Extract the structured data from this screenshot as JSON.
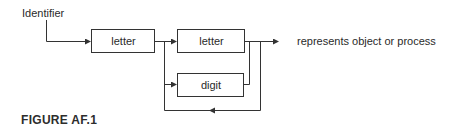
{
  "diagram": {
    "start_label": "Identifier",
    "nodes": [
      {
        "id": "letter1",
        "label": "letter"
      },
      {
        "id": "letter2",
        "label": "letter"
      },
      {
        "id": "digit",
        "label": "digit"
      }
    ],
    "output_label": "represents object or process",
    "edges": [
      {
        "from": "Identifier",
        "to": "letter1"
      },
      {
        "from": "letter1",
        "to": "letter2"
      },
      {
        "from": "letter1",
        "to": "digit"
      },
      {
        "from": "letter2",
        "to": "output"
      },
      {
        "from": "digit",
        "to": "output"
      },
      {
        "from": "output",
        "to": "loop-back",
        "note": "loop returns to before letter/digit choice"
      }
    ],
    "colors": {
      "line": "#333333",
      "text": "#2a2a2a",
      "background": "#ffffff"
    }
  },
  "caption": "FIGURE AF.1"
}
